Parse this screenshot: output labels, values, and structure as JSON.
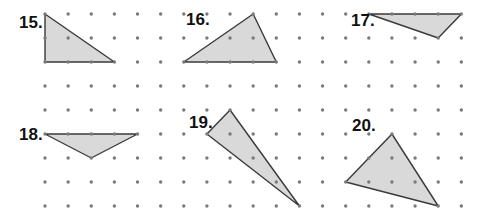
{
  "grid": {
    "origin_x": 45,
    "origin_y": 14,
    "dx": 23.13,
    "dy": 24,
    "cols": 19,
    "rows": 9,
    "dot_color": "#7a7a7a",
    "dot_radius": 1.7
  },
  "style": {
    "fill": "#d9d9d9",
    "stroke": "#3a3a3a",
    "stroke_width": 1.4
  },
  "problems": [
    {
      "label": "15.",
      "label_pos": [
        19,
        28
      ],
      "vertices": [
        [
          0,
          0
        ],
        [
          0,
          2
        ],
        [
          3,
          2
        ]
      ]
    },
    {
      "label": "16.",
      "label_pos": [
        186,
        25
      ],
      "vertices": [
        [
          6,
          2
        ],
        [
          9,
          0
        ],
        [
          10,
          2
        ]
      ]
    },
    {
      "label": "17.",
      "label_pos": [
        351,
        26
      ],
      "vertices": [
        [
          14,
          0
        ],
        [
          18,
          0
        ],
        [
          17,
          1
        ]
      ]
    },
    {
      "label": "18.",
      "label_pos": [
        19,
        140
      ],
      "vertices": [
        [
          0,
          5
        ],
        [
          4,
          5
        ],
        [
          2,
          6
        ]
      ]
    },
    {
      "label": "19.",
      "label_pos": [
        189,
        128
      ],
      "vertices": [
        [
          7,
          5
        ],
        [
          8,
          4
        ],
        [
          11,
          8
        ]
      ]
    },
    {
      "label": "20.",
      "label_pos": [
        352,
        131
      ],
      "vertices": [
        [
          15,
          5
        ],
        [
          13,
          7
        ],
        [
          17,
          8
        ]
      ]
    }
  ]
}
